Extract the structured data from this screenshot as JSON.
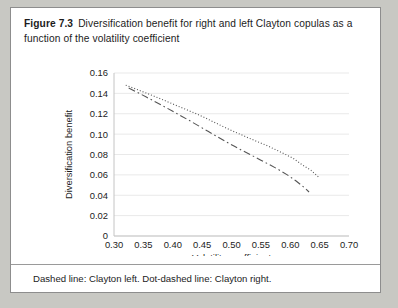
{
  "figure": {
    "number": "Figure 7.3",
    "title": "Diversification benefit for right and left Clayton copulas as a function of the volatility coefficient",
    "caption": "Dashed line: Clayton left. Dot-dashed line: Clayton right.",
    "background_color": "#c8c8c3",
    "card_color": "#ffffff",
    "border_color": "#8d8d8d",
    "line_color": "#555555",
    "grid_color": "#e9e9e9"
  },
  "chart_data": {
    "type": "line",
    "title": "",
    "xlabel": "Volatility coefficient",
    "ylabel": "Diversification benefit",
    "xlim": [
      0.3,
      0.7
    ],
    "ylim": [
      0,
      0.16
    ],
    "xticks": [
      0.3,
      0.35,
      0.4,
      0.45,
      0.5,
      0.55,
      0.6,
      0.65,
      0.7
    ],
    "xtick_labels": [
      "0.30",
      "0.35",
      "0.40",
      "0.45",
      "0.50",
      "0.55",
      "0.60",
      "0.65",
      "0.70"
    ],
    "yticks": [
      0,
      0.02,
      0.04,
      0.06,
      0.08,
      0.1,
      0.12,
      0.14,
      0.16
    ],
    "ytick_labels": [
      "0",
      "0.02",
      "0.04",
      "0.06",
      "0.08",
      "0.10",
      "0.12",
      "0.14",
      "0.16"
    ],
    "grid": true,
    "grid_axis": "y",
    "legend": "none",
    "legend_note": "Dashed line: Clayton left. Dot-dashed line: Clayton right.",
    "series": [
      {
        "name": "Clayton right",
        "style": "dotted",
        "dasharray": "1,2",
        "x": [
          0.32,
          0.335,
          0.35,
          0.365,
          0.38,
          0.395,
          0.41,
          0.425,
          0.44,
          0.455,
          0.47,
          0.485,
          0.5,
          0.515,
          0.53,
          0.545,
          0.56,
          0.575,
          0.59,
          0.605,
          0.62,
          0.635,
          0.65
        ],
        "y": [
          0.148,
          0.1448,
          0.1414,
          0.138,
          0.1345,
          0.1308,
          0.1272,
          0.1236,
          0.12,
          0.116,
          0.1118,
          0.1076,
          0.1036,
          0.0998,
          0.096,
          0.0924,
          0.0888,
          0.0848,
          0.0806,
          0.0762,
          0.07,
          0.0646,
          0.057
        ]
      },
      {
        "name": "Clayton left",
        "style": "dash-dot",
        "dasharray": "7,3,1.6,3",
        "x": [
          0.325,
          0.34,
          0.355,
          0.37,
          0.385,
          0.4,
          0.415,
          0.43,
          0.445,
          0.46,
          0.475,
          0.49,
          0.505,
          0.52,
          0.535,
          0.55,
          0.565,
          0.58,
          0.595,
          0.61,
          0.625,
          0.632
        ],
        "y": [
          0.1452,
          0.141,
          0.1364,
          0.1318,
          0.1272,
          0.1224,
          0.1176,
          0.1128,
          0.1078,
          0.1028,
          0.0978,
          0.0928,
          0.088,
          0.0834,
          0.079,
          0.0744,
          0.07,
          0.0652,
          0.06,
          0.054,
          0.047,
          0.0432
        ]
      }
    ]
  }
}
